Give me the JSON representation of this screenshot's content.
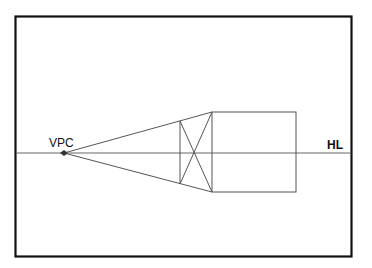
{
  "diagram": {
    "type": "one-point-perspective",
    "labels": {
      "vanishing_point": "VPC",
      "horizon_line": "HL"
    },
    "colors": {
      "frame": "#111111",
      "lines": "#555555",
      "background": "#ffffff"
    }
  }
}
